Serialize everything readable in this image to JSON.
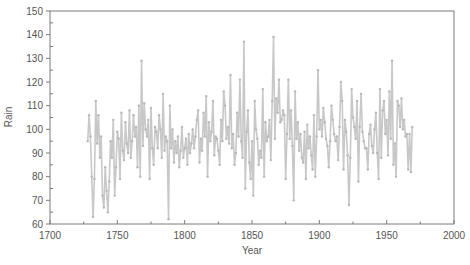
{
  "chart_data": {
    "type": "line",
    "title": "",
    "xlabel": "Year",
    "ylabel": "Rain",
    "xlim": [
      1700,
      2000
    ],
    "ylim": [
      60,
      150
    ],
    "x_ticks": [
      1700,
      1750,
      1800,
      1850,
      1900,
      1950,
      2000
    ],
    "y_ticks": [
      60,
      70,
      80,
      90,
      100,
      110,
      120,
      130,
      140,
      150
    ],
    "x_minor_step": 25,
    "y_minor_step": 5,
    "grid": false,
    "legend": null,
    "markers": true,
    "series": [
      {
        "name": "Rain",
        "color": "#c8c8c8",
        "x_start": 1728,
        "x_end": 1975,
        "values": [
          95,
          106,
          97,
          80,
          63,
          79,
          112,
          94,
          106,
          88,
          97,
          72,
          67,
          84,
          74,
          65,
          78,
          95,
          88,
          104,
          72,
          84,
          99,
          96,
          79,
          107,
          91,
          87,
          103,
          94,
          90,
          108,
          88,
          95,
          106,
          97,
          101,
          84,
          110,
          80,
          129,
          93,
          111,
          100,
          97,
          104,
          79,
          109,
          92,
          85,
          101,
          99,
          92,
          106,
          100,
          88,
          115,
          91,
          97,
          95,
          62,
          110,
          92,
          100,
          86,
          95,
          90,
          97,
          84,
          91,
          101,
          88,
          92,
          96,
          85,
          98,
          90,
          94,
          100,
          92,
          97,
          104,
          108,
          86,
          96,
          91,
          107,
          97,
          114,
          80,
          103,
          95,
          99,
          112,
          89,
          97,
          96,
          91,
          85,
          104,
          95,
          116,
          110,
          96,
          101,
          94,
          123,
          92,
          98,
          85,
          90,
          107,
          97,
          121,
          95,
          88,
          137,
          75,
          99,
          108,
          86,
          79,
          95,
          72,
          112,
          100,
          96,
          85,
          91,
          88,
          117,
          80,
          103,
          95,
          97,
          104,
          87,
          112,
          139,
          96,
          113,
          107,
          121,
          103,
          104,
          108,
          106,
          79,
          98,
          121,
          96,
          108,
          93,
          70,
          116,
          96,
          103,
          91,
          98,
          88,
          86,
          99,
          79,
          102,
          92,
          97,
          89,
          83,
          106,
          80,
          97,
          125,
          100,
          104,
          97,
          109,
          103,
          96,
          93,
          84,
          95,
          110,
          104,
          98,
          95,
          97,
          87,
          101,
          120,
          112,
          83,
          104,
          99,
          89,
          68,
          88,
          117,
          105,
          101,
          96,
          112,
          78,
          101,
          115,
          99,
          95,
          92,
          92,
          83,
          98,
          102,
          93,
          90,
          100,
          107,
          90,
          79,
          117,
          88,
          108,
          112,
          98,
          104,
          89,
          116,
          96,
          129,
          85,
          94,
          80,
          112,
          110,
          101,
          113,
          100,
          104,
          97,
          98,
          83,
          98,
          82,
          101
        ]
      }
    ]
  }
}
